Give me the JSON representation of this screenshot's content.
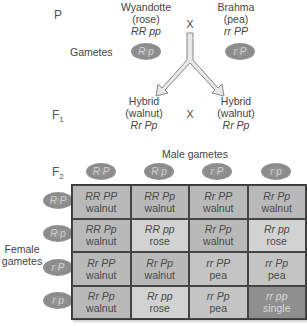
{
  "generations": {
    "p": "P",
    "f1": "F",
    "f1_sub": "1",
    "f2": "F",
    "f2_sub": "2"
  },
  "parents": {
    "left": {
      "breed": "Wyandotte",
      "phenotype": "(rose)",
      "genotype": "RR pp",
      "gamete": "R p"
    },
    "right": {
      "breed": "Brahma",
      "phenotype": "(pea)",
      "genotype": "rr PP",
      "gamete": "r P"
    },
    "cross_symbol": "X"
  },
  "gametes_label": "Gametes",
  "f1": {
    "left": {
      "name": "Hybrid",
      "phenotype": "(walnut)",
      "genotype": "Rr Pp"
    },
    "right": {
      "name": "Hybrid",
      "phenotype": "(walnut)",
      "genotype": "Rr Pp"
    },
    "cross_symbol": "X"
  },
  "punnett": {
    "male_label": "Male gametes",
    "female_label_line1": "Female",
    "female_label_line2": "gametes",
    "male_gametes": [
      "R P",
      "R p",
      "r P",
      "r p"
    ],
    "female_gametes": [
      "R P",
      "R p",
      "r P",
      "r p"
    ],
    "colors": {
      "walnut": "#b9b9b9",
      "rose": "#d2d2d2",
      "pea": "#c4c4c4",
      "single": "#8f8f8f"
    },
    "rows": [
      [
        {
          "genotype": "RR PP",
          "phenotype": "walnut"
        },
        {
          "genotype": "RR Pp",
          "phenotype": "walnut"
        },
        {
          "genotype": "Rr PP",
          "phenotype": "walnut"
        },
        {
          "genotype": "Rr Pp",
          "phenotype": "walnut"
        }
      ],
      [
        {
          "genotype": "RR Pp",
          "phenotype": "walnut"
        },
        {
          "genotype": "RR pp",
          "phenotype": "rose"
        },
        {
          "genotype": "Rr Pp",
          "phenotype": "walnut"
        },
        {
          "genotype": "Rr pp",
          "phenotype": "rose"
        }
      ],
      [
        {
          "genotype": "Rr PP",
          "phenotype": "walnut"
        },
        {
          "genotype": "Rr Pp",
          "phenotype": "walnut"
        },
        {
          "genotype": "rr PP",
          "phenotype": "pea"
        },
        {
          "genotype": "rr Pp",
          "phenotype": "pea"
        }
      ],
      [
        {
          "genotype": "Rr Pp",
          "phenotype": "walnut"
        },
        {
          "genotype": "Rr pp",
          "phenotype": "rose"
        },
        {
          "genotype": "rr Pp",
          "phenotype": "pea"
        },
        {
          "genotype": "rr pp",
          "phenotype": "single"
        }
      ]
    ]
  }
}
